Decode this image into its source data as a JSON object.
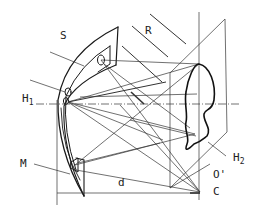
{
  "diagram": {
    "labels": {
      "S": "S",
      "R": "R",
      "H1_main": "H",
      "H1_sub": "1",
      "H2_main": "H",
      "H2_sub": "2",
      "M": "M",
      "d": "d",
      "O_prime": "O'",
      "C": "C"
    },
    "colors": {
      "stroke": "#1a1a1a",
      "thin": "#333333",
      "background": "#ffffff"
    }
  }
}
